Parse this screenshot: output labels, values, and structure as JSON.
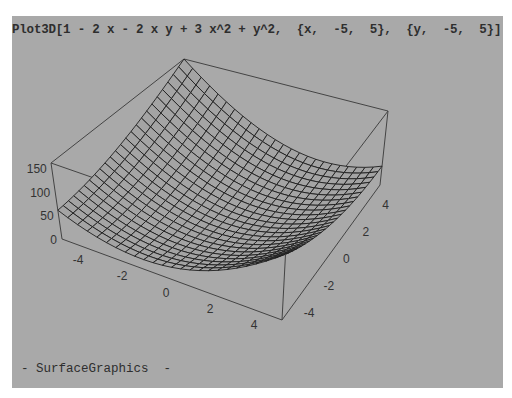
{
  "notebook": {
    "input_cell": "Plot3D[1 - 2 x - 2 x y + 3 x^2 + y^2,  {x,  -5,  5},  {y,  -5,  5}]",
    "output_cell": "- SurfaceGraphics  -"
  },
  "colors": {
    "page_background": "#ffffff",
    "cell_background": "#a9a9a9",
    "text": "#2e2e2e",
    "mesh": "#1e1e1e",
    "surface_fill": "#a4a4a4",
    "box_edge": "#444444"
  },
  "chart_data": {
    "type": "surface",
    "title": "",
    "function": "1 - 2x - 2xy + 3x^2 + y^2",
    "x_range": [
      -5,
      5
    ],
    "y_range": [
      -5,
      5
    ],
    "z_range": [
      0,
      161
    ],
    "mesh_lines": 25,
    "corner_values": [
      {
        "x": -5,
        "y": -5,
        "z": 61
      },
      {
        "x": 5,
        "y": -5,
        "z": 141
      },
      {
        "x": 5,
        "y": 5,
        "z": 41
      },
      {
        "x": -5,
        "y": 5,
        "z": 161
      }
    ],
    "x_ticks": [
      "-4",
      "-2",
      "0",
      "2",
      "4"
    ],
    "y_ticks": [
      "-4",
      "-2",
      "0",
      "2",
      "4"
    ],
    "z_ticks": [
      "0",
      "50",
      "100",
      "150"
    ],
    "boxed": true,
    "grid": false
  }
}
